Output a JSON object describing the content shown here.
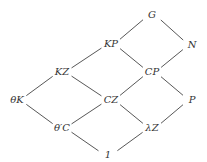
{
  "diagram": {
    "type": "hasse-lattice",
    "nodes": [
      {
        "id": "G",
        "label": "G",
        "x": 152,
        "y": 15
      },
      {
        "id": "KP",
        "label": "KP",
        "x": 111,
        "y": 44
      },
      {
        "id": "N",
        "label": "N",
        "x": 192,
        "y": 45
      },
      {
        "id": "KZ",
        "label": "KZ",
        "x": 62,
        "y": 72
      },
      {
        "id": "CP",
        "label": "CP",
        "x": 152,
        "y": 72
      },
      {
        "id": "thetaK",
        "label": "θK",
        "x": 17,
        "y": 100
      },
      {
        "id": "CZ",
        "label": "CZ",
        "x": 111,
        "y": 100
      },
      {
        "id": "P",
        "label": "P",
        "x": 192,
        "y": 100
      },
      {
        "id": "thetaPrimeC",
        "label": "θ′C",
        "x": 62,
        "y": 128
      },
      {
        "id": "lambdaZ",
        "label": "λZ",
        "x": 152,
        "y": 128
      },
      {
        "id": "one",
        "label": "1",
        "x": 108,
        "y": 155
      }
    ],
    "edges": [
      [
        "G",
        "KP"
      ],
      [
        "G",
        "N"
      ],
      [
        "KP",
        "KZ"
      ],
      [
        "KP",
        "CP"
      ],
      [
        "N",
        "CP"
      ],
      [
        "KZ",
        "thetaK"
      ],
      [
        "KZ",
        "CZ"
      ],
      [
        "CP",
        "CZ"
      ],
      [
        "CP",
        "P"
      ],
      [
        "thetaK",
        "thetaPrimeC"
      ],
      [
        "CZ",
        "thetaPrimeC"
      ],
      [
        "CZ",
        "lambdaZ"
      ],
      [
        "P",
        "lambdaZ"
      ],
      [
        "thetaPrimeC",
        "one"
      ],
      [
        "lambdaZ",
        "one"
      ]
    ]
  }
}
